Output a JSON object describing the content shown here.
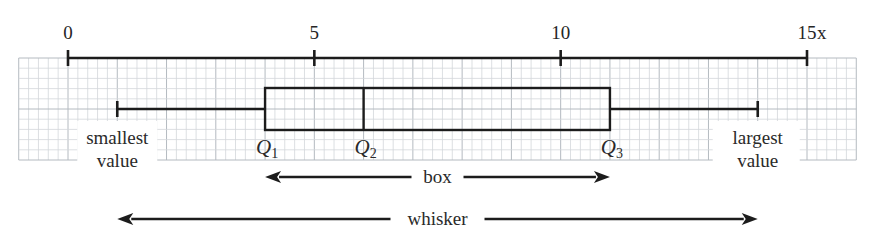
{
  "chart_data": {
    "type": "box",
    "title": "",
    "xlabel": "x",
    "ylabel": "",
    "xlim": [
      0,
      15
    ],
    "grid": true,
    "grid_range": [
      -1,
      16
    ],
    "grid_minor_step": 0.2,
    "ticks": [
      0,
      5,
      10,
      15
    ],
    "tick_labels": [
      "0",
      "5",
      "10",
      "15"
    ],
    "series": [
      {
        "name": "box plot",
        "min": 1,
        "q1": 4,
        "median": 6,
        "q3": 11,
        "max": 14
      }
    ]
  },
  "labels": {
    "axis_variable": "x",
    "smallest": {
      "line1": "smallest",
      "line2": "value"
    },
    "largest": {
      "line1": "largest",
      "line2": "value"
    },
    "q1": {
      "letter": "Q",
      "sub": "1"
    },
    "q2": {
      "letter": "Q",
      "sub": "2"
    },
    "q3": {
      "letter": "Q",
      "sub": "3"
    },
    "box": "box",
    "whisker": "whisker"
  }
}
